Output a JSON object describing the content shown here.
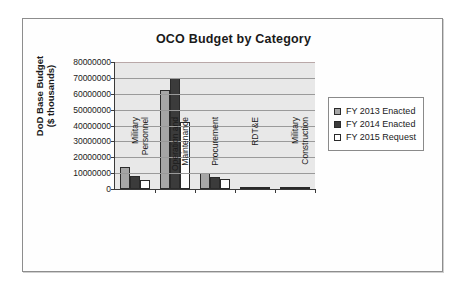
{
  "chart_data": {
    "type": "bar",
    "title": "OCO Budget by Category",
    "xlabel": "",
    "ylabel_line1": "DoD Base Budget",
    "ylabel_line2": "($ thousands)",
    "ylim": [
      0,
      80000000
    ],
    "ytick_step": 10000000,
    "grid": true,
    "legend_position": "right",
    "categories": [
      "Military Personnel",
      "Operation and Maintenance",
      "Procurement",
      "RDT&E",
      "Military Construction"
    ],
    "category_lines": [
      [
        "Military",
        "Personnel"
      ],
      [
        "Operation and",
        "Maintenance"
      ],
      [
        "Procurement"
      ],
      [
        "RDT&E"
      ],
      [
        "Military",
        "Construction"
      ]
    ],
    "ytick_labels": [
      "80000000",
      "70000000",
      "60000000",
      "50000000",
      "40000000",
      "30000000",
      "20000000",
      "10000000",
      "0"
    ],
    "series": [
      {
        "name": "FY 2013 Enacted",
        "color": "#a6a6a6",
        "values": [
          14000000,
          62500000,
          10000000,
          400000,
          200000
        ]
      },
      {
        "name": "FY 2014 Enacted",
        "color": "#3b3b3b",
        "values": [
          8000000,
          70000000,
          7500000,
          350000,
          150000
        ]
      },
      {
        "name": "FY 2015 Request",
        "color": "#ffffff",
        "values": [
          5500000,
          42000000,
          6000000,
          300000,
          150000
        ]
      }
    ]
  },
  "legend": {
    "items": [
      {
        "label": "FY 2013 Enacted"
      },
      {
        "label": "FY 2014 Enacted"
      },
      {
        "label": "FY 2015 Request"
      }
    ]
  }
}
